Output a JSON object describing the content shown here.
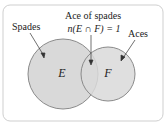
{
  "diagram": {
    "type": "venn",
    "sets": [
      {
        "id": "E",
        "label": "E",
        "caption": "Spades"
      },
      {
        "id": "F",
        "label": "F",
        "caption": "Aces"
      }
    ],
    "intersection": {
      "caption": "Ace of spades",
      "formula": "n(E ∩ F) = 1"
    },
    "colors": {
      "circle_fill": "#d9d9d9",
      "circle_stroke": "#888888",
      "border": "#cccccc"
    }
  }
}
